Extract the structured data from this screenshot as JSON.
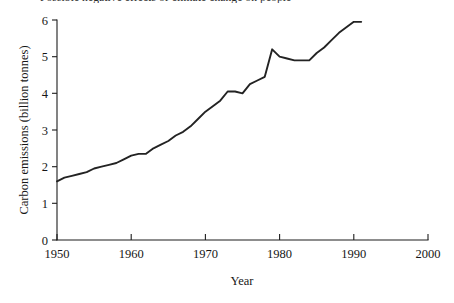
{
  "figure": {
    "clipped_caption": "Possible negative effects of climate change on people",
    "background_color": "#ffffff",
    "line_color": "#232323",
    "axis_color": "#1d1d1d"
  },
  "chart_data": {
    "type": "line",
    "title": "",
    "xlabel": "Year",
    "ylabel": "Carbon emissions (billion tonnes)",
    "xlim": [
      1950,
      2000
    ],
    "ylim": [
      0,
      6
    ],
    "grid": false,
    "legend": null,
    "xticks": [
      1950,
      1960,
      1970,
      1980,
      1990,
      2000
    ],
    "yticks": [
      0,
      1,
      2,
      3,
      4,
      5,
      6
    ],
    "xtick_labels": [
      "1950",
      "1960",
      "1970",
      "1980",
      "1990",
      "2000"
    ],
    "ytick_labels": [
      "0",
      "1",
      "2",
      "3",
      "4",
      "5",
      "6"
    ],
    "series": [
      {
        "name": "Carbon emissions",
        "x": [
          1950,
          1951,
          1952,
          1953,
          1954,
          1955,
          1956,
          1957,
          1958,
          1959,
          1960,
          1961,
          1962,
          1963,
          1964,
          1965,
          1966,
          1967,
          1968,
          1969,
          1970,
          1971,
          1972,
          1973,
          1974,
          1975,
          1976,
          1977,
          1978,
          1979,
          1980,
          1981,
          1982,
          1983,
          1984,
          1985,
          1986,
          1987,
          1988,
          1989,
          1990,
          1991
        ],
        "values": [
          1.6,
          1.7,
          1.75,
          1.8,
          1.85,
          1.95,
          2.0,
          2.05,
          2.1,
          2.2,
          2.3,
          2.35,
          2.35,
          2.5,
          2.6,
          2.7,
          2.85,
          2.95,
          3.1,
          3.3,
          3.5,
          3.65,
          3.8,
          4.05,
          4.05,
          4.0,
          4.25,
          4.35,
          4.45,
          5.2,
          5.0,
          4.95,
          4.9,
          4.9,
          4.9,
          5.1,
          5.25,
          5.45,
          5.65,
          5.8,
          5.95,
          5.95
        ]
      }
    ]
  }
}
